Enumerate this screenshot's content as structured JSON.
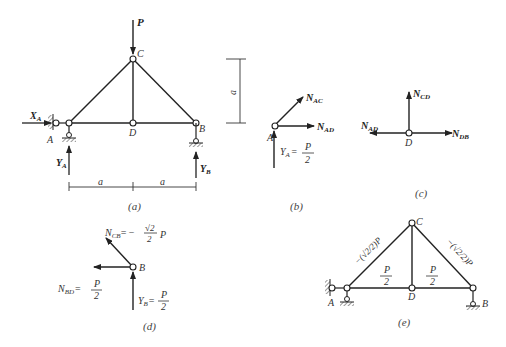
{
  "figure": {
    "panels": [
      {
        "id": "a",
        "caption": "(a)"
      },
      {
        "id": "b",
        "caption": "(b)"
      },
      {
        "id": "c",
        "caption": "(c)"
      },
      {
        "id": "d",
        "caption": "(d)"
      },
      {
        "id": "e",
        "caption": "(e)"
      }
    ]
  },
  "panel_a": {
    "load": "P",
    "nodes": {
      "A": "A",
      "B": "B",
      "C": "C",
      "D": "D"
    },
    "reactions": {
      "XA_main": "X",
      "XA_sub": "A",
      "YA_main": "Y",
      "YA_sub": "A",
      "YB_main": "Y",
      "YB_sub": "B"
    },
    "dim_left": "a",
    "dim_right": "a",
    "dim_height": "a",
    "caption": "(a)"
  },
  "panel_b": {
    "node": "A",
    "NAC_main": "N",
    "NAC_sub": "AC",
    "NAD_main": "N",
    "NAD_sub": "AD",
    "YA_main": "Y",
    "YA_sub": "A",
    "YA_eq": "=",
    "YA_num": "P",
    "YA_den": "2",
    "caption": "(b)"
  },
  "panel_c": {
    "node": "D",
    "NCD_main": "N",
    "NCD_sub": "CD",
    "NAD_main": "N",
    "NAD_sub": "AD",
    "NDB_main": "N",
    "NDB_sub": "DB",
    "caption": "(c)"
  },
  "panel_d": {
    "node": "B",
    "NCB_main": "N",
    "NCB_sub": "CB",
    "NCB_eq": "= −",
    "NCB_num": "√2",
    "NCB_den": "2",
    "NCB_tail": "P",
    "NBD_main": "N",
    "NBD_sub": "BD",
    "NBD_eq": "=",
    "NBD_num": "P",
    "NBD_den": "2",
    "YB_main": "Y",
    "YB_sub": "B",
    "YB_eq": "=",
    "YB_num": "P",
    "YB_den": "2",
    "caption": "(d)"
  },
  "panel_e": {
    "nodes": {
      "A": "A",
      "B": "B",
      "C": "C",
      "D": "D"
    },
    "AC_label": "−(√2/2)P",
    "CB_label": "−(√2/2)P",
    "AD_num": "P",
    "AD_den": "2",
    "DB_num": "P",
    "DB_den": "2",
    "caption": "(e)"
  }
}
